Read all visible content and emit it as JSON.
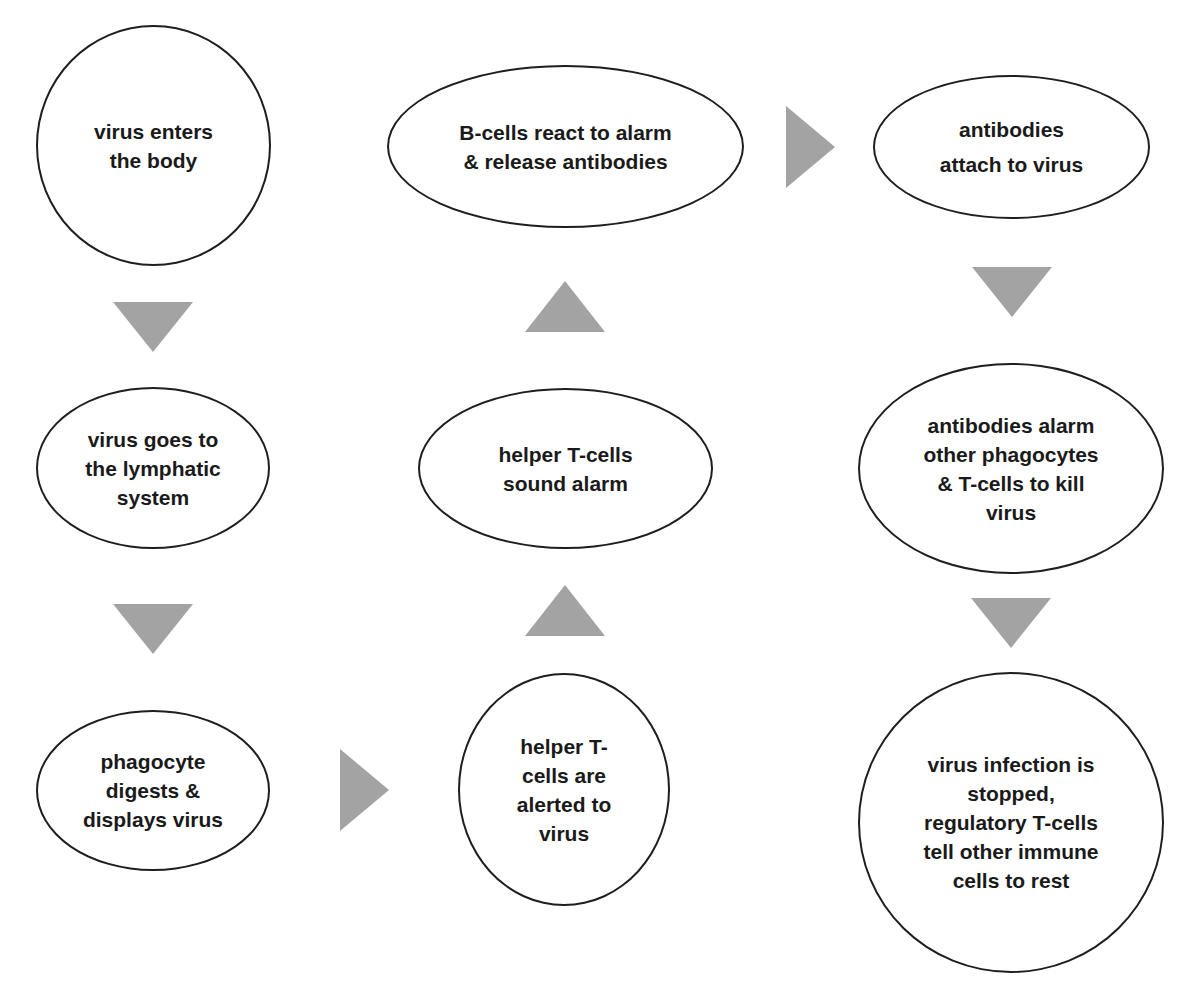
{
  "diagram": {
    "type": "flowchart",
    "title": "",
    "colors": {
      "node_border": "#1e1e1e",
      "node_fill": "#ffffff",
      "text": "#1a1a1a",
      "arrow": "#a3a3a3",
      "background": "#ffffff"
    },
    "nodes": [
      {
        "id": "n1",
        "shape": "circle",
        "label": "virus enters\nthe body"
      },
      {
        "id": "n2",
        "shape": "ellipse",
        "label": "virus goes to\nthe lymphatic\nsystem"
      },
      {
        "id": "n3",
        "shape": "ellipse",
        "label": "phagocyte\ndigests &\ndisplays virus"
      },
      {
        "id": "n4",
        "shape": "circle",
        "label": "helper T-\ncells are\nalerted to\nvirus"
      },
      {
        "id": "n5",
        "shape": "ellipse",
        "label": "helper T-cells\nsound alarm"
      },
      {
        "id": "n6",
        "shape": "ellipse",
        "label": "B-cells react to alarm\n& release antibodies"
      },
      {
        "id": "n7",
        "shape": "ellipse",
        "label": "antibodies\nattach to virus"
      },
      {
        "id": "n8",
        "shape": "ellipse",
        "label": "antibodies alarm\nother phagocytes\n& T-cells to kill\nvirus"
      },
      {
        "id": "n9",
        "shape": "circle",
        "label": "virus infection is\nstopped,\nregulatory T-cells\ntell other immune\ncells to rest"
      }
    ],
    "edges": [
      {
        "from": "n1",
        "to": "n2",
        "direction": "down"
      },
      {
        "from": "n2",
        "to": "n3",
        "direction": "down"
      },
      {
        "from": "n3",
        "to": "n4",
        "direction": "right"
      },
      {
        "from": "n4",
        "to": "n5",
        "direction": "up"
      },
      {
        "from": "n5",
        "to": "n6",
        "direction": "up"
      },
      {
        "from": "n6",
        "to": "n7",
        "direction": "right"
      },
      {
        "from": "n7",
        "to": "n8",
        "direction": "down"
      },
      {
        "from": "n8",
        "to": "n9",
        "direction": "down"
      }
    ]
  }
}
